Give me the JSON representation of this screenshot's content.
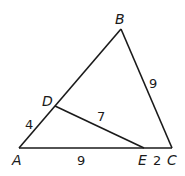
{
  "diagram": {
    "type": "triangle",
    "points": {
      "A": {
        "label": "A",
        "x": 19,
        "y": 148
      },
      "B": {
        "label": "B",
        "x": 121,
        "y": 29
      },
      "C": {
        "label": "C",
        "x": 172,
        "y": 148
      },
      "D": {
        "label": "D",
        "x": 55,
        "y": 106
      },
      "E": {
        "label": "E",
        "x": 144,
        "y": 148
      }
    },
    "segments": [
      {
        "from": "A",
        "to": "B"
      },
      {
        "from": "B",
        "to": "C"
      },
      {
        "from": "A",
        "to": "C"
      },
      {
        "from": "D",
        "to": "E"
      }
    ],
    "lengths": {
      "AD": "4",
      "DE": "7",
      "AE": "9",
      "EC": "2",
      "BC": "9"
    },
    "stroke_color": "#1a1a1a"
  }
}
